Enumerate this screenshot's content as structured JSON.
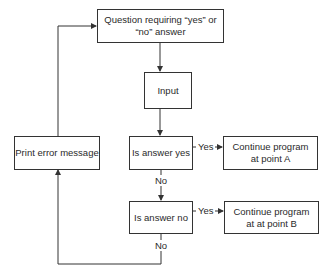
{
  "diagram": {
    "type": "flowchart",
    "nodes": {
      "question": {
        "label": "Question requiring “yes” or “no” answer"
      },
      "input": {
        "label": "Input"
      },
      "is_yes": {
        "label": "Is answer yes"
      },
      "is_no": {
        "label": "Is answer no"
      },
      "continue_a": {
        "label": "Continue program at point A"
      },
      "continue_b": {
        "label": "Continue program at at point B"
      },
      "print_error": {
        "label": "Print error message"
      }
    },
    "edge_labels": {
      "yes_1": "Yes",
      "no_1": "No",
      "yes_2": "Yes",
      "no_2": "No"
    },
    "edges": [
      {
        "from": "question",
        "to": "input"
      },
      {
        "from": "input",
        "to": "is_yes"
      },
      {
        "from": "is_yes",
        "to": "continue_a",
        "label": "Yes"
      },
      {
        "from": "is_yes",
        "to": "is_no",
        "label": "No"
      },
      {
        "from": "is_no",
        "to": "continue_b",
        "label": "Yes"
      },
      {
        "from": "is_no",
        "to": "print_error",
        "label": "No"
      },
      {
        "from": "print_error",
        "to": "question"
      }
    ],
    "colors": {
      "line": "#333333",
      "background": "#ffffff"
    }
  }
}
